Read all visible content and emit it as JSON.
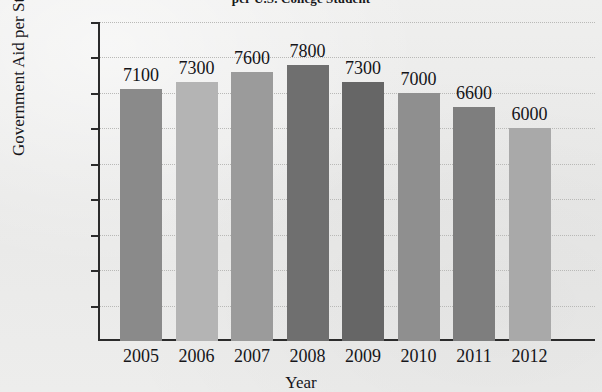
{
  "chart_data": {
    "type": "bar",
    "title": "per U.S. College Student",
    "xlabel": "Year",
    "ylabel": "Government Aid per Student",
    "categories": [
      "2005",
      "2006",
      "2007",
      "2008",
      "2009",
      "2010",
      "2011",
      "2012"
    ],
    "values": [
      7100,
      7300,
      7600,
      7800,
      7300,
      7000,
      6600,
      6000
    ],
    "value_labels": [
      "7100",
      "7300",
      "7600",
      "7800",
      "7300",
      "7000",
      "6600",
      "6000"
    ],
    "ytick_labels": [
      "$9000",
      "$8000",
      "$7000",
      "$6000",
      "$5000",
      "$4000",
      "$3000",
      "$2000",
      "$1000"
    ],
    "ytick_values": [
      9000,
      8000,
      7000,
      6000,
      5000,
      4000,
      3000,
      2000,
      1000
    ],
    "ylim": [
      0,
      9000
    ],
    "grid": true,
    "legend": "none",
    "bar_colors": [
      "#8a8a8a",
      "#b4b4b4",
      "#9b9b9b",
      "#6f6f6f",
      "#666666",
      "#8f8f8f",
      "#7e7e7e",
      "#a9a9a9"
    ]
  }
}
